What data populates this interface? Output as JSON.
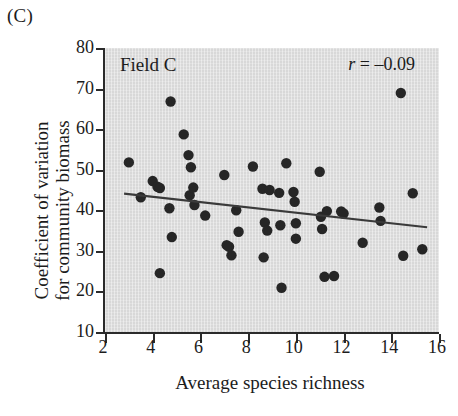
{
  "panel": {
    "letter": "(C)"
  },
  "labels": {
    "xlabel": "Average species richness",
    "ylabel_line1": "Coefficient of variation",
    "ylabel_line2": "for community biomass"
  },
  "annotations": {
    "field": "Field C",
    "r_symbol": "r",
    "r_value": " = –0.09"
  },
  "chart_data": {
    "type": "scatter",
    "title": "Field C",
    "xlabel": "Average species richness",
    "ylabel": "Coefficient of variation for community biomass",
    "xlim": [
      2,
      16
    ],
    "ylim": [
      10,
      80
    ],
    "xticks": [
      2,
      4,
      6,
      8,
      10,
      12,
      14,
      16
    ],
    "yticks": [
      10,
      20,
      30,
      40,
      50,
      60,
      70,
      80
    ],
    "grid": false,
    "legend": null,
    "annotation": "r = –0.09",
    "correlation_r": -0.09,
    "marker_color": "#262626",
    "fit_line_color": "#3a3a3a",
    "plot_background": "#d8d8d8",
    "points": [
      [
        3.0,
        51.8
      ],
      [
        3.5,
        43.2
      ],
      [
        4.0,
        47.2
      ],
      [
        4.2,
        45.8
      ],
      [
        4.3,
        45.5
      ],
      [
        4.3,
        24.5
      ],
      [
        4.7,
        40.5
      ],
      [
        4.75,
        66.8
      ],
      [
        4.8,
        33.4
      ],
      [
        5.3,
        58.7
      ],
      [
        5.5,
        53.6
      ],
      [
        5.55,
        43.7
      ],
      [
        5.6,
        50.6
      ],
      [
        5.7,
        45.6
      ],
      [
        5.75,
        41.3
      ],
      [
        6.2,
        38.7
      ],
      [
        7.0,
        48.7
      ],
      [
        7.1,
        31.4
      ],
      [
        7.2,
        31.0
      ],
      [
        7.3,
        28.9
      ],
      [
        7.5,
        40.0
      ],
      [
        7.6,
        34.7
      ],
      [
        8.2,
        50.8
      ],
      [
        8.6,
        45.3
      ],
      [
        8.65,
        28.4
      ],
      [
        8.7,
        37.0
      ],
      [
        8.8,
        35.0
      ],
      [
        8.9,
        45.0
      ],
      [
        9.3,
        44.3
      ],
      [
        9.35,
        36.3
      ],
      [
        9.4,
        20.9
      ],
      [
        9.6,
        51.6
      ],
      [
        9.9,
        44.5
      ],
      [
        9.95,
        42.1
      ],
      [
        10.0,
        36.8
      ],
      [
        10.0,
        33.0
      ],
      [
        11.0,
        49.5
      ],
      [
        11.05,
        38.4
      ],
      [
        11.1,
        35.4
      ],
      [
        11.2,
        23.6
      ],
      [
        11.3,
        39.8
      ],
      [
        11.6,
        23.8
      ],
      [
        11.9,
        39.7
      ],
      [
        12.0,
        39.2
      ],
      [
        12.8,
        32.0
      ],
      [
        13.5,
        40.7
      ],
      [
        13.55,
        37.4
      ],
      [
        14.4,
        68.9
      ],
      [
        14.5,
        28.8
      ],
      [
        14.9,
        44.2
      ],
      [
        15.3,
        30.4
      ]
    ],
    "fit_line": {
      "x1": 2.8,
      "y1": 44.1,
      "x2": 15.5,
      "y2": 35.8
    }
  }
}
